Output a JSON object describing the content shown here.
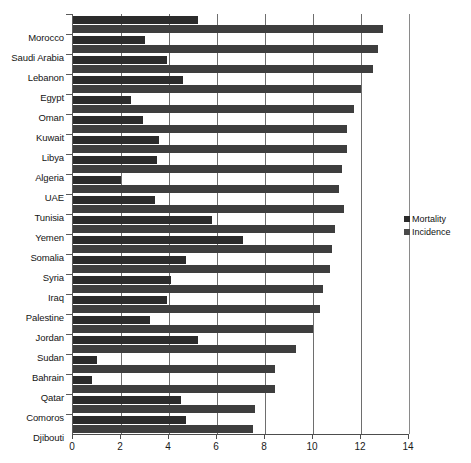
{
  "chart_data": {
    "type": "bar",
    "orientation": "horizontal",
    "title": "",
    "xlabel": "",
    "ylabel": "",
    "xlim": [
      0,
      14
    ],
    "xticks": [
      0,
      2,
      4,
      6,
      8,
      10,
      12,
      14
    ],
    "xtick_labels": [
      "0",
      "2",
      "4",
      "6",
      "8",
      "10",
      "12",
      "14"
    ],
    "grid": true,
    "grid_axis": "x",
    "legend_position": "right",
    "categories": [
      "Morocco",
      "Saudi Arabia",
      "Lebanon",
      "Egypt",
      "Oman",
      "Kuwait",
      "Libya",
      "Algeria",
      "UAE",
      "Tunisia",
      "Yemen",
      "Somalia",
      "Syria",
      "Iraq",
      "Palestine",
      "Jordan",
      "Sudan",
      "Bahrain",
      "Qatar",
      "Comoros",
      "Djibouti"
    ],
    "series": [
      {
        "name": "Mortality",
        "color": "#2b2b2b",
        "values": [
          5.2,
          3.0,
          3.9,
          4.6,
          2.4,
          2.9,
          3.6,
          3.5,
          2.0,
          3.4,
          5.8,
          7.1,
          4.7,
          4.1,
          3.9,
          3.2,
          5.2,
          1.0,
          0.8,
          4.5,
          4.7
        ]
      },
      {
        "name": "Incidence",
        "color": "#3e3e3e",
        "values": [
          12.9,
          12.7,
          12.5,
          12.0,
          11.7,
          11.4,
          11.4,
          11.2,
          11.1,
          11.3,
          10.9,
          10.8,
          10.7,
          10.4,
          10.3,
          10.0,
          9.3,
          8.4,
          8.4,
          7.6,
          7.5
        ]
      }
    ]
  },
  "legend": {
    "items": [
      {
        "label": "Mortality",
        "color": "#2b2b2b"
      },
      {
        "label": "Incidence",
        "color": "#4a4a4a"
      }
    ]
  }
}
